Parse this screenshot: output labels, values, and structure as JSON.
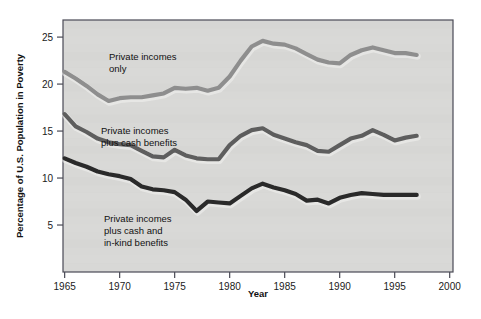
{
  "figure": {
    "background_color": "#ffffff",
    "plot_background_color": "#d8d8d6",
    "frame_color": "#4a4a55",
    "bullet_marker": "bullet-dot"
  },
  "axes": {
    "y_title": "Percentage of U.S. Population in Poverty",
    "x_title": "Year",
    "y_ticks": [
      "5",
      "10",
      "15",
      "20",
      "25"
    ],
    "x_ticks": [
      "1965",
      "1970",
      "1975",
      "1980",
      "1985",
      "1990",
      "1995",
      "2000"
    ]
  },
  "series_labels": {
    "top": "Private incomes\nonly",
    "top_line1": "Private incomes",
    "top_line2": "only",
    "middle_line1": "Private incomes",
    "middle_line2": "plus cash benefits",
    "bottom_line1": "Private incomes",
    "bottom_line2": "plus cash and",
    "bottom_line3": "in-kind benefits"
  },
  "chart_data": {
    "type": "line",
    "title": "",
    "xlabel": "Year",
    "ylabel": "Percentage of U.S. Population in Poverty",
    "xlim": [
      1964,
      2000
    ],
    "ylim": [
      0,
      26.8
    ],
    "x_ticks": [
      1965,
      1970,
      1975,
      1980,
      1985,
      1990,
      1995,
      2000
    ],
    "y_ticks": [
      5,
      10,
      15,
      20,
      25
    ],
    "grid": false,
    "legend": "inline-labels",
    "x": [
      1965,
      1966,
      1967,
      1968,
      1969,
      1970,
      1971,
      1972,
      1973,
      1974,
      1975,
      1976,
      1977,
      1978,
      1979,
      1980,
      1981,
      1982,
      1983,
      1984,
      1985,
      1986,
      1987,
      1988,
      1989,
      1990,
      1991,
      1992,
      1993,
      1994,
      1995,
      1996,
      1997
    ],
    "series": [
      {
        "name": "Private incomes only",
        "color": "#8e8e8e",
        "values": [
          21.3,
          20.6,
          19.8,
          18.9,
          18.2,
          18.5,
          18.6,
          18.6,
          18.8,
          19.0,
          19.6,
          19.5,
          19.6,
          19.3,
          19.6,
          20.8,
          22.5,
          24.0,
          24.6,
          24.3,
          24.2,
          23.8,
          23.2,
          22.6,
          22.3,
          22.2,
          23.1,
          23.6,
          23.9,
          23.6,
          23.3,
          23.3,
          23.1
        ]
      },
      {
        "name": "Private incomes plus cash benefits",
        "color": "#5e5e5e",
        "values": [
          16.8,
          15.5,
          14.9,
          14.2,
          13.8,
          13.6,
          13.5,
          12.9,
          12.3,
          12.2,
          13.0,
          12.4,
          12.1,
          12.0,
          12.0,
          13.5,
          14.5,
          15.1,
          15.3,
          14.6,
          14.2,
          13.8,
          13.5,
          12.9,
          12.8,
          13.5,
          14.2,
          14.5,
          15.1,
          14.6,
          14.0,
          14.3,
          14.5
        ]
      },
      {
        "name": "Private incomes plus cash and in-kind benefits",
        "color": "#2a2a2a",
        "values": [
          12.1,
          11.6,
          11.2,
          10.7,
          10.4,
          10.2,
          9.9,
          9.1,
          8.8,
          8.7,
          8.5,
          7.7,
          6.5,
          7.5,
          7.4,
          7.3,
          8.1,
          8.9,
          9.4,
          9.0,
          8.7,
          8.3,
          7.6,
          7.7,
          7.3,
          7.9,
          8.2,
          8.4,
          8.3,
          8.2,
          8.2,
          8.2,
          8.2
        ]
      }
    ]
  }
}
